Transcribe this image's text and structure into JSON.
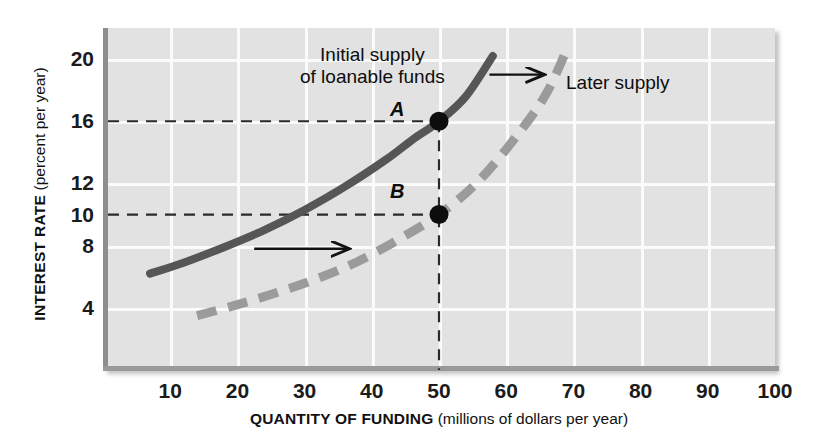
{
  "chart_data": {
    "type": "line",
    "title": "",
    "xlabel_bold": "QUANTITY OF FUNDING",
    "xlabel_paren": "(millions of dollars per year)",
    "ylabel_bold": "INTEREST RATE",
    "ylabel_paren": "(percent per year)",
    "xlim": [
      0,
      100
    ],
    "ylim": [
      0,
      22
    ],
    "xticks": [
      10,
      20,
      30,
      40,
      50,
      60,
      70,
      80,
      90,
      100
    ],
    "yticks": [
      4,
      8,
      10,
      12,
      16,
      20
    ],
    "grid": true,
    "legend_position": "inline-annotations",
    "series": [
      {
        "name": "Initial supply of loanable funds",
        "style": "solid",
        "color": "#565656",
        "points": [
          {
            "x": 7,
            "y": 6.2
          },
          {
            "x": 12,
            "y": 6.9
          },
          {
            "x": 18,
            "y": 7.9
          },
          {
            "x": 24,
            "y": 9.0
          },
          {
            "x": 30,
            "y": 10.3
          },
          {
            "x": 36,
            "y": 11.8
          },
          {
            "x": 42,
            "y": 13.5
          },
          {
            "x": 46,
            "y": 14.8
          },
          {
            "x": 50,
            "y": 16.0
          },
          {
            "x": 54,
            "y": 17.6
          },
          {
            "x": 58,
            "y": 20.2
          }
        ]
      },
      {
        "name": "Later supply",
        "style": "dashed",
        "color": "#9b9b9b",
        "points": [
          {
            "x": 14,
            "y": 3.5
          },
          {
            "x": 20,
            "y": 4.2
          },
          {
            "x": 26,
            "y": 5.0
          },
          {
            "x": 32,
            "y": 5.9
          },
          {
            "x": 38,
            "y": 7.0
          },
          {
            "x": 44,
            "y": 8.4
          },
          {
            "x": 50,
            "y": 10.0
          },
          {
            "x": 56,
            "y": 12.2
          },
          {
            "x": 62,
            "y": 15.3
          },
          {
            "x": 66,
            "y": 17.8
          },
          {
            "x": 69,
            "y": 20.6
          }
        ]
      }
    ],
    "annotations": [
      {
        "name": "initial-supply-label",
        "text_line1": "Initial supply",
        "text_line2": "of loanable funds"
      },
      {
        "name": "later-supply-label",
        "text": "Later supply"
      }
    ],
    "markers": [
      {
        "label": "A",
        "x": 50,
        "y": 16,
        "color": "#0d0d0d"
      },
      {
        "label": "B",
        "x": 50,
        "y": 10,
        "color": "#0d0d0d"
      }
    ],
    "reference_lines": [
      {
        "name": "rate-16-guide",
        "orientation": "horizontal",
        "value": 16,
        "style": "dashed"
      },
      {
        "name": "rate-10-guide",
        "orientation": "horizontal",
        "value": 10,
        "style": "dashed"
      },
      {
        "name": "quantity-50-guide",
        "orientation": "vertical",
        "value": 50,
        "style": "dashed"
      }
    ],
    "shift_arrows": [
      {
        "name": "upper-shift-arrow",
        "from_x": 57.5,
        "from_y": 19.0,
        "to_x": 65.5,
        "to_y": 19.0
      },
      {
        "name": "lower-shift-arrow",
        "from_x": 22.5,
        "from_y": 7.8,
        "to_x": 36.5,
        "to_y": 7.8
      }
    ]
  }
}
